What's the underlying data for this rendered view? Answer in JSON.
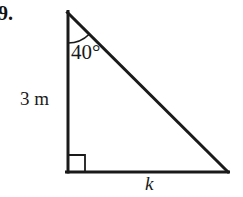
{
  "figure": {
    "problem_number": "19.",
    "type": "right-triangle-diagram",
    "background_color": "#ffffff",
    "stroke_color": "#1a1a1a",
    "labels": {
      "angle": "40°",
      "vertical_leg": "3 m",
      "base": "k"
    },
    "geometry": {
      "apex": {
        "x": 68,
        "y": 13
      },
      "right_angle_vertex": {
        "x": 68,
        "y": 172
      },
      "base_right_vertex": {
        "x": 228,
        "y": 172
      },
      "angle_arc_radius": 30,
      "right_angle_marker_size": 17,
      "stroke_width": 3
    }
  }
}
